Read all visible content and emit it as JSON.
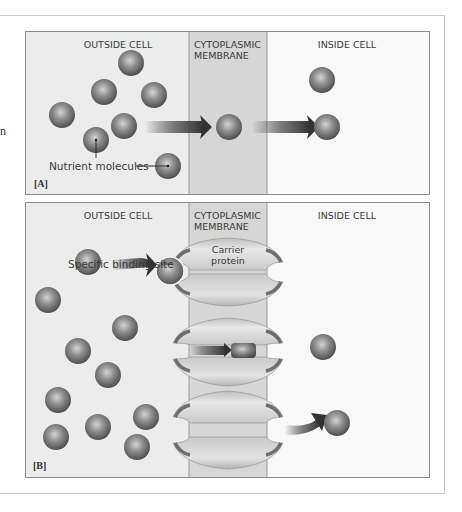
{
  "figure": {
    "colors": {
      "outside_bg": "#ececec",
      "membrane_bg": "#d6d6d6",
      "inside_bg": "#f7f7f7",
      "panel_border": "#8a8a8a",
      "molecule": "#7c7c7c",
      "carrier": "#cfcfcf",
      "binding_site": "#6e6e6e",
      "arrow": "#3c3c3c"
    },
    "cut_off_text": "n",
    "panels": [
      {
        "id": "A",
        "tag": "[A]",
        "region_labels": {
          "outside": "OUTSIDE CELL",
          "membrane_line1": "CYTOPLASMIC",
          "membrane_line2": "MEMBRANE",
          "inside": "INSIDE CELL"
        },
        "annotations": {
          "nutrient_molecules": "Nutrient molecules"
        }
      },
      {
        "id": "B",
        "tag": "[B]",
        "region_labels": {
          "outside": "OUTSIDE CELL",
          "membrane_line1": "CYTOPLASMIC",
          "membrane_line2": "MEMBRANE",
          "inside": "INSIDE CELL"
        },
        "annotations": {
          "binding_site": "Specific binding site",
          "carrier_line1": "Carrier",
          "carrier_line2": "protein"
        }
      }
    ]
  }
}
